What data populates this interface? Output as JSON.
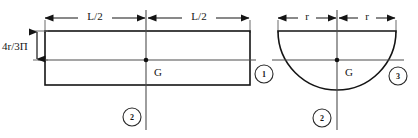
{
  "figure": {
    "colors": {
      "outline": "#141414",
      "axis": "#4d4d4d",
      "dimension": "#141414",
      "background": "#ffffff",
      "marker_stroke": "#2a2a2a"
    }
  },
  "shapes": {
    "rectangle": {
      "name": "rectangle",
      "centroid_label": "G",
      "dimensions": {
        "left_half": "L/2",
        "right_half": "L/2",
        "vertical_offset": "4r/3Π"
      },
      "axis_markers": {
        "horizontal": "1",
        "vertical": "2"
      }
    },
    "semicircle": {
      "name": "semicircle",
      "centroid_label": "G",
      "dimensions": {
        "left_radius": "r",
        "right_radius": "r"
      },
      "axis_markers": {
        "horizontal": "3",
        "vertical": "2"
      }
    }
  },
  "labels": {
    "rect_dim_left": "L/2",
    "rect_dim_right": "L/2",
    "rect_offset": "4r/3Π",
    "rect_centroid": "G",
    "rect_axis_h": "1",
    "rect_axis_v": "2",
    "semi_dim_left": "r",
    "semi_dim_right": "r",
    "semi_centroid": "G",
    "semi_axis_h": "3",
    "semi_axis_v": "2"
  }
}
